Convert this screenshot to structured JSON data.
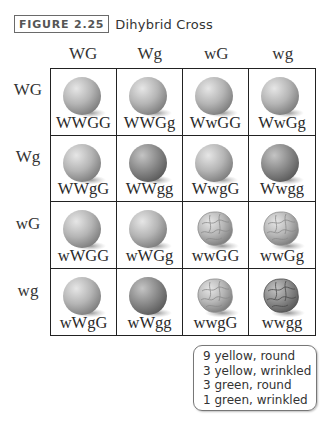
{
  "figure": {
    "label": "FIGURE 2.25",
    "title": "Dihybrid Cross"
  },
  "punnett": {
    "column_gametes": [
      "WG",
      "Wg",
      "wG",
      "wg"
    ],
    "row_gametes": [
      "WG",
      "Wg",
      "wG",
      "wg"
    ],
    "cells": [
      [
        {
          "genotype": "WWGG",
          "shape": "round",
          "shade": "light"
        },
        {
          "genotype": "WWGg",
          "shape": "round",
          "shade": "light"
        },
        {
          "genotype": "WwGG",
          "shape": "round",
          "shade": "light"
        },
        {
          "genotype": "WwGg",
          "shape": "round",
          "shade": "light"
        }
      ],
      [
        {
          "genotype": "WWgG",
          "shape": "round",
          "shade": "light"
        },
        {
          "genotype": "WWgg",
          "shape": "round",
          "shade": "dark"
        },
        {
          "genotype": "WwgG",
          "shape": "round",
          "shade": "light"
        },
        {
          "genotype": "Wwgg",
          "shape": "round",
          "shade": "dark"
        }
      ],
      [
        {
          "genotype": "wWGG",
          "shape": "round",
          "shade": "light"
        },
        {
          "genotype": "wWGg",
          "shape": "round",
          "shade": "light"
        },
        {
          "genotype": "wwGG",
          "shape": "wrinkled",
          "shade": "light"
        },
        {
          "genotype": "wwGg",
          "shape": "wrinkled",
          "shade": "light"
        }
      ],
      [
        {
          "genotype": "wWgG",
          "shape": "round",
          "shade": "light"
        },
        {
          "genotype": "wWgg",
          "shape": "round",
          "shade": "dark"
        },
        {
          "genotype": "wwgG",
          "shape": "wrinkled",
          "shade": "light"
        },
        {
          "genotype": "wwgg",
          "shape": "wrinkled",
          "shade": "dark"
        }
      ]
    ]
  },
  "summary": {
    "lines": [
      "9 yellow, round",
      "3 yellow, wrinkled",
      "3 green, round",
      "1 green, wrinkled"
    ]
  },
  "colors": {
    "pea_light": "#b8b8b8",
    "pea_dark": "#8a8a8a",
    "grid_line": "#222222"
  }
}
